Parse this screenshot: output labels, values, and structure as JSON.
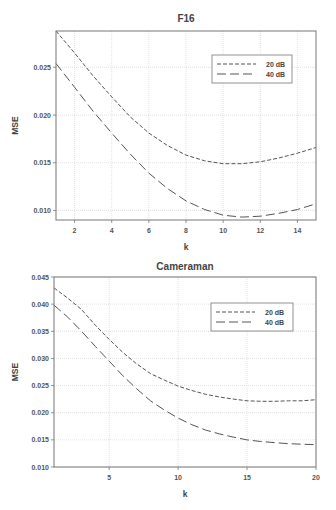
{
  "chart_data": [
    {
      "type": "line",
      "title": "F16",
      "xlabel": "k",
      "ylabel": "MSE",
      "xlim": [
        1,
        15
      ],
      "ylim": [
        0.009,
        0.0288
      ],
      "grid": true,
      "legend_position": "upper right",
      "xticks": [
        2,
        4,
        6,
        8,
        10,
        12,
        14
      ],
      "xtick_labels": [
        "2",
        "4",
        "6",
        "8",
        "10",
        "12",
        "14"
      ],
      "yticks": [
        0.01,
        0.015,
        0.02,
        0.025
      ],
      "ytick_labels": [
        "0.010",
        "0.015",
        "0.020",
        "0.025"
      ],
      "x": [
        1,
        2,
        3,
        4,
        5,
        6,
        7,
        8,
        9,
        10,
        11,
        12,
        13,
        14,
        15
      ],
      "series": [
        {
          "name": "20 dB",
          "style": "short-dash",
          "values": [
            0.0288,
            0.0265,
            0.0241,
            0.0219,
            0.0198,
            0.0181,
            0.0168,
            0.0158,
            0.0152,
            0.0149,
            0.0149,
            0.0151,
            0.0155,
            0.016,
            0.0166
          ]
        },
        {
          "name": "40 dB",
          "style": "long-dash",
          "values": [
            0.0254,
            0.0229,
            0.0204,
            0.0181,
            0.0159,
            0.0139,
            0.0123,
            0.011,
            0.0101,
            0.0095,
            0.0093,
            0.0094,
            0.0097,
            0.0101,
            0.0107
          ]
        }
      ]
    },
    {
      "type": "line",
      "title": "Cameraman",
      "xlabel": "k",
      "ylabel": "MSE",
      "xlim": [
        1,
        20
      ],
      "ylim": [
        0.01,
        0.045
      ],
      "grid": true,
      "legend_position": "upper right",
      "xticks": [
        5,
        10,
        15,
        20
      ],
      "xtick_labels": [
        "5",
        "10",
        "15",
        "20"
      ],
      "yticks": [
        0.01,
        0.015,
        0.02,
        0.025,
        0.03,
        0.035,
        0.04,
        0.045
      ],
      "ytick_labels": [
        "0.010",
        "0.015",
        "0.020",
        "0.025",
        "0.030",
        "0.035",
        "0.040",
        "0.045"
      ],
      "x": [
        1,
        2,
        3,
        4,
        5,
        6,
        7,
        8,
        9,
        10,
        11,
        12,
        13,
        14,
        15,
        16,
        17,
        18,
        19,
        20
      ],
      "series": [
        {
          "name": "20 dB",
          "style": "short-dash",
          "values": [
            0.043,
            0.0411,
            0.039,
            0.0361,
            0.0335,
            0.0311,
            0.029,
            0.0272,
            0.026,
            0.0249,
            0.0241,
            0.0234,
            0.0229,
            0.0225,
            0.0222,
            0.0221,
            0.0221,
            0.0222,
            0.0222,
            0.0224
          ]
        },
        {
          "name": "40 dB",
          "style": "long-dash",
          "values": [
            0.0398,
            0.0376,
            0.035,
            0.0322,
            0.0295,
            0.0268,
            0.0244,
            0.0222,
            0.0205,
            0.019,
            0.0178,
            0.0168,
            0.0161,
            0.0155,
            0.015,
            0.0147,
            0.0145,
            0.0143,
            0.0142,
            0.0141
          ]
        }
      ]
    }
  ],
  "colors": {
    "axis": "#777777",
    "grid": "#cccccc",
    "line": "#555555"
  }
}
